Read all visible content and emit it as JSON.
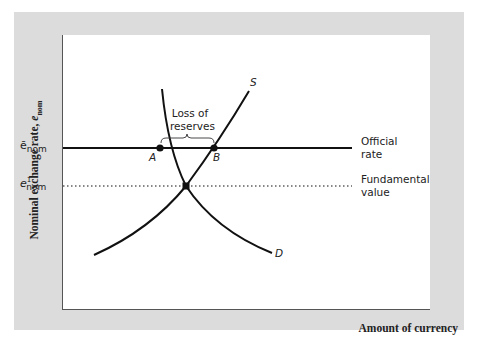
{
  "diagram": {
    "type": "supply-demand exchange rate diagram",
    "y_axis": {
      "label_main": "Nominal exchange rate, ",
      "label_var": "e",
      "label_sub": "nom"
    },
    "x_axis": {
      "label": "Amount of currency"
    },
    "y_ticks": {
      "official": {
        "base": "ē",
        "sub": "nom"
      },
      "fundamental": {
        "base": "e",
        "sup": "1",
        "sub": "nom"
      }
    },
    "lines": {
      "official_rate": {
        "label_line1": "Official",
        "label_line2": "rate",
        "style": "solid"
      },
      "fundamental_value": {
        "label_line1": "Fundamental",
        "label_line2": "value",
        "style": "dotted"
      }
    },
    "curves": {
      "supply": {
        "label": "S"
      },
      "demand": {
        "label": "D"
      }
    },
    "points": {
      "a": {
        "label": "A"
      },
      "b": {
        "label": "B"
      }
    },
    "annotation": {
      "line1": "Loss of",
      "line2": "reserves"
    },
    "colors": {
      "panel": "#dcdcdc",
      "plot": "#ffffff",
      "ink": "#111111"
    }
  }
}
